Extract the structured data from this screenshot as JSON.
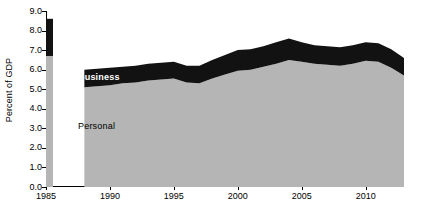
{
  "chart_data": {
    "type": "area",
    "title": "",
    "subtitle": "",
    "xlabel": "",
    "ylabel": "Percent of GDP",
    "ylim": [
      0.0,
      9.0
    ],
    "xlim": [
      1985,
      2013
    ],
    "grid": false,
    "legend_position": "inline-labels",
    "stacked": true,
    "y_ticks": [
      "0.0",
      "1.0",
      "2.0",
      "3.0",
      "4.0",
      "5.0",
      "6.0",
      "7.0",
      "8.0",
      "9.0"
    ],
    "y_tick_values": [
      0.0,
      1.0,
      2.0,
      3.0,
      4.0,
      5.0,
      6.0,
      7.0,
      8.0,
      9.0
    ],
    "x_ticks": [
      "1985",
      "1990",
      "1995",
      "2000",
      "2005",
      "2010"
    ],
    "x_tick_values": [
      1985,
      1990,
      1995,
      2000,
      2005,
      2010
    ],
    "series": [
      {
        "name": "Personal",
        "color": "#b5b5b5",
        "label_text": "Personal",
        "values": [
          6.7,
          null,
          null,
          5.1,
          5.15,
          5.2,
          5.3,
          5.35,
          5.45,
          5.5,
          5.55,
          5.35,
          5.3,
          5.55,
          5.75,
          5.95,
          6.0,
          6.15,
          6.3,
          6.5,
          6.4,
          6.3,
          6.25,
          6.2,
          6.3,
          6.45,
          6.4,
          6.1,
          5.7
        ]
      },
      {
        "name": "Business",
        "color": "#121212",
        "label_text": "Business",
        "values": [
          1.9,
          null,
          null,
          0.9,
          0.9,
          0.9,
          0.85,
          0.85,
          0.85,
          0.85,
          0.85,
          0.85,
          0.9,
          0.95,
          1.0,
          1.05,
          1.05,
          1.05,
          1.1,
          1.1,
          1.0,
          0.95,
          0.95,
          0.95,
          0.95,
          0.95,
          0.95,
          0.95,
          0.9
        ]
      }
    ],
    "x": [
      1985,
      1986,
      1987,
      1988,
      1989,
      1990,
      1991,
      1992,
      1993,
      1994,
      1995,
      1996,
      1997,
      1998,
      1999,
      2000,
      2001,
      2002,
      2003,
      2004,
      2005,
      2006,
      2007,
      2008,
      2009,
      2010,
      2011,
      2012,
      2013
    ],
    "totals": [
      8.6,
      null,
      null,
      6.0,
      6.05,
      6.1,
      6.15,
      6.2,
      6.3,
      6.35,
      6.4,
      6.2,
      6.2,
      6.5,
      6.75,
      7.0,
      7.05,
      7.2,
      7.4,
      7.6,
      7.4,
      7.25,
      7.2,
      7.15,
      7.25,
      7.4,
      7.35,
      7.05,
      6.6
    ],
    "standalone_bar": {
      "year": 1985,
      "personal": 6.7,
      "business_top": 8.6
    },
    "area_start_year": 1988,
    "area_end_year": 2013,
    "annotations": [
      {
        "text": "Business",
        "color": "#ffffff"
      },
      {
        "text": "Personal",
        "color": "#000000"
      }
    ]
  }
}
